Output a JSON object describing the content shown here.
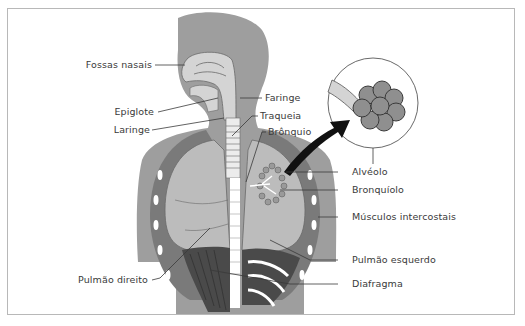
{
  "diagram": {
    "colors": {
      "body": "#9e9e9e",
      "airway": "#d4d4d4",
      "lung": "#bcbcbc",
      "lung_outline": "#6a6a6a",
      "diaphragm": "#4a4a4a",
      "ribs": "#ffffff",
      "label_text": "#3a3a3a",
      "leader_line": "#3a3a3a",
      "frame_border": "#b8b8b8",
      "arrow": "#111111"
    },
    "labels": {
      "fossas_nasais": "Fossas nasais",
      "faringe": "Faringe",
      "epiglote": "Epiglote",
      "laringe": "Laringe",
      "traqueia": "Traqueia",
      "bronquio": "Brônquio",
      "alveolo": "Alvéolo",
      "bronquiolo": "Bronquíolo",
      "musculos_intercostais": "Músculos intercostais",
      "pulmao_esquerdo": "Pulmão esquerdo",
      "pulmao_direito": "Pulmão direito",
      "diafragma": "Diafragma"
    },
    "inset": {
      "name": "alveoli-magnified",
      "description": "Detalhe ampliado dos alvéolos"
    }
  }
}
